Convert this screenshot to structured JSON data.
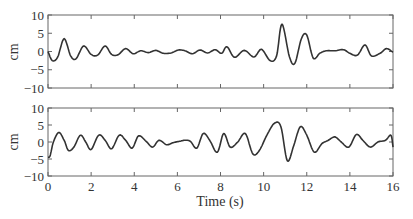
{
  "chart_data": [
    {
      "type": "line",
      "title": "",
      "xlabel": "",
      "ylabel": "cm",
      "xlim": [
        0,
        16
      ],
      "ylim": [
        -10,
        10
      ],
      "yticks": [
        -10,
        -5,
        0,
        5,
        10
      ],
      "xticks": [
        0,
        2,
        4,
        6,
        8,
        10,
        12,
        14,
        16
      ],
      "grid": false,
      "series": [
        {
          "name": "displacement-top",
          "x": [
            0,
            0.2,
            0.45,
            0.75,
            1.05,
            1.3,
            1.65,
            2.0,
            2.3,
            2.65,
            2.95,
            3.25,
            3.6,
            3.95,
            4.3,
            4.65,
            5.0,
            5.35,
            5.7,
            6.05,
            6.35,
            6.7,
            7.05,
            7.4,
            7.75,
            8.05,
            8.3,
            8.65,
            9.1,
            9.55,
            9.9,
            10.3,
            10.6,
            10.85,
            11.2,
            11.45,
            11.75,
            12.0,
            12.3,
            12.6,
            12.9,
            13.3,
            13.7,
            14.0,
            14.35,
            14.7,
            15.0,
            15.4,
            15.7,
            16.0
          ],
          "y": [
            0,
            -2.5,
            -1.5,
            3.5,
            -1.2,
            -2.0,
            1.5,
            -0.8,
            -1.0,
            1.5,
            -0.8,
            -0.9,
            0.8,
            -0.6,
            0.2,
            -0.3,
            0.3,
            -0.5,
            -0.4,
            0.4,
            0.2,
            -0.6,
            0.4,
            -0.4,
            0.5,
            -0.5,
            1.3,
            -1.6,
            0.3,
            -1.5,
            0.6,
            -2.5,
            -1.2,
            7.5,
            -1.5,
            -3.2,
            3.5,
            4.5,
            -1.8,
            -0.5,
            0.2,
            0.2,
            0.5,
            -0.5,
            -1.0,
            1.8,
            -1.2,
            -0.5,
            0.8,
            -0.2
          ]
        }
      ]
    },
    {
      "type": "line",
      "title": "",
      "xlabel": "Time (s)",
      "ylabel": "cm",
      "xlim": [
        0,
        16
      ],
      "ylim": [
        -10,
        10
      ],
      "yticks": [
        -10,
        -5,
        0,
        5,
        10
      ],
      "xticks": [
        0,
        2,
        4,
        6,
        8,
        10,
        12,
        14,
        16
      ],
      "grid": false,
      "series": [
        {
          "name": "displacement-bottom",
          "x": [
            0,
            0.1,
            0.25,
            0.5,
            0.75,
            0.95,
            1.2,
            1.5,
            1.75,
            2.0,
            2.35,
            2.65,
            2.95,
            3.3,
            3.6,
            3.9,
            4.2,
            4.55,
            4.85,
            5.15,
            5.5,
            5.8,
            6.1,
            6.35,
            6.6,
            6.9,
            7.2,
            7.5,
            7.85,
            8.15,
            8.45,
            8.8,
            9.15,
            9.5,
            9.8,
            10.15,
            10.5,
            10.8,
            11.1,
            11.4,
            11.7,
            12.0,
            12.35,
            12.7,
            13.0,
            13.3,
            13.6,
            13.95,
            14.3,
            14.6,
            14.95,
            15.3,
            15.65,
            15.9,
            16.0
          ],
          "y": [
            -4.5,
            -4.0,
            0,
            2.8,
            0.5,
            -2.5,
            -1.5,
            2.0,
            0,
            -2.2,
            2.0,
            0.5,
            -2.0,
            2.0,
            0.5,
            -1.8,
            1.8,
            0.2,
            -1.5,
            0.5,
            -0.8,
            -0.2,
            0.2,
            0.5,
            0.2,
            -1.8,
            2.5,
            0.5,
            -3.0,
            2.5,
            -1.5,
            0,
            2.5,
            -3.5,
            -2.5,
            2.0,
            5.5,
            4.5,
            -5.5,
            -1.0,
            4.5,
            2.0,
            -3.0,
            -0.5,
            0.5,
            1.5,
            0,
            -1.5,
            2.2,
            0.5,
            -1.5,
            0,
            0.5,
            2.0,
            -1.5
          ]
        }
      ]
    }
  ],
  "panels": {
    "top": {
      "ylabel": "cm",
      "ytick_labels": [
        "10",
        "5",
        "0",
        "−5",
        "−10"
      ]
    },
    "bottom": {
      "ylabel": "cm",
      "ytick_labels": [
        "10",
        "5",
        "0",
        "−5",
        "−10"
      ]
    }
  },
  "xaxis": {
    "tick_labels": [
      "0",
      "2",
      "4",
      "6",
      "8",
      "10",
      "12",
      "14",
      "16"
    ],
    "label": "Time (s)"
  },
  "colors": {
    "line": "#333333",
    "axes": "#555555",
    "background": "#ffffff"
  }
}
